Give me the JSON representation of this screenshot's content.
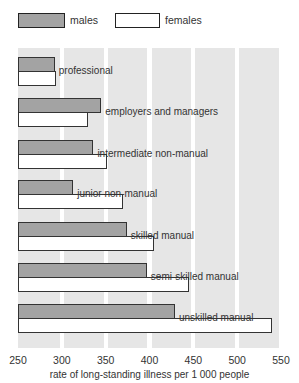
{
  "chart_data": {
    "type": "bar",
    "orientation": "horizontal",
    "title": "",
    "xlabel": "rate of long-standing illness per 1 000 people",
    "ylabel": "",
    "xlim": [
      250,
      550
    ],
    "xticks": [
      "250",
      "300",
      "350",
      "400",
      "450",
      "500",
      "550"
    ],
    "grid": true,
    "legend_position": "top",
    "categories": [
      "professional",
      "employers and managers",
      "intermediate non-manual",
      "junior non-manual",
      "skilled manual",
      "semi-skilled manual",
      "unskilled manual"
    ],
    "series": [
      {
        "name": "males",
        "color": "#a3a3a3",
        "values": [
          292,
          345,
          336,
          313,
          374,
          397,
          429
        ]
      },
      {
        "name": "females",
        "color": "#ffffff",
        "values": [
          293,
          330,
          352,
          370,
          405,
          445,
          540
        ]
      }
    ]
  },
  "legend": {
    "males": "males",
    "females": "females"
  }
}
